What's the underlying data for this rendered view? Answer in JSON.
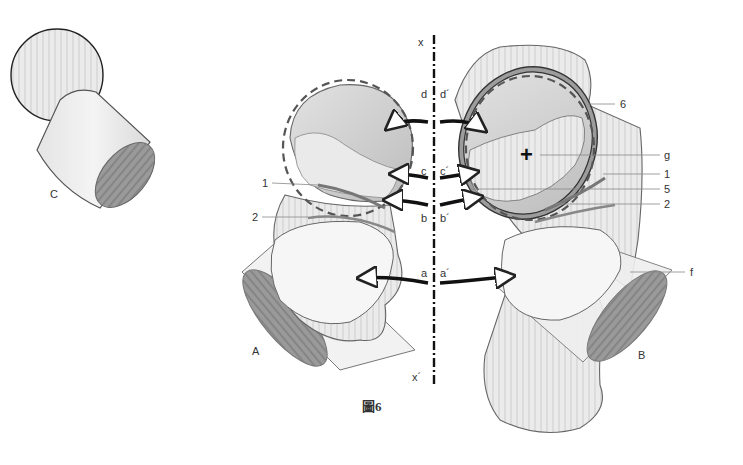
{
  "figure": {
    "caption": "圖6",
    "axis": {
      "top_label": "x",
      "bottom_label": "x´"
    },
    "panels": {
      "A": "A",
      "B": "B",
      "C": "C"
    },
    "axis_pairs": [
      {
        "left": "d",
        "right": "d´"
      },
      {
        "left": "c",
        "right": "c´"
      },
      {
        "left": "b",
        "right": "b´"
      },
      {
        "left": "a",
        "right": "a´"
      }
    ],
    "left_callouts": [
      {
        "id": "1",
        "label": "1"
      },
      {
        "id": "2",
        "label": "2"
      }
    ],
    "right_callouts": [
      {
        "id": "6",
        "label": "6"
      },
      {
        "id": "g",
        "label": "g"
      },
      {
        "id": "1",
        "label": "1"
      },
      {
        "id": "5",
        "label": "5"
      },
      {
        "id": "2",
        "label": "2"
      },
      {
        "id": "f",
        "label": "f"
      }
    ],
    "center_mark": "+",
    "colors": {
      "stroke": "#555555",
      "light_fill": "#ececec",
      "mid_fill": "#d4d4d4",
      "dark_fill": "#8a8a8a",
      "arrow": "#111111",
      "dashed_circle": "#666666"
    }
  }
}
